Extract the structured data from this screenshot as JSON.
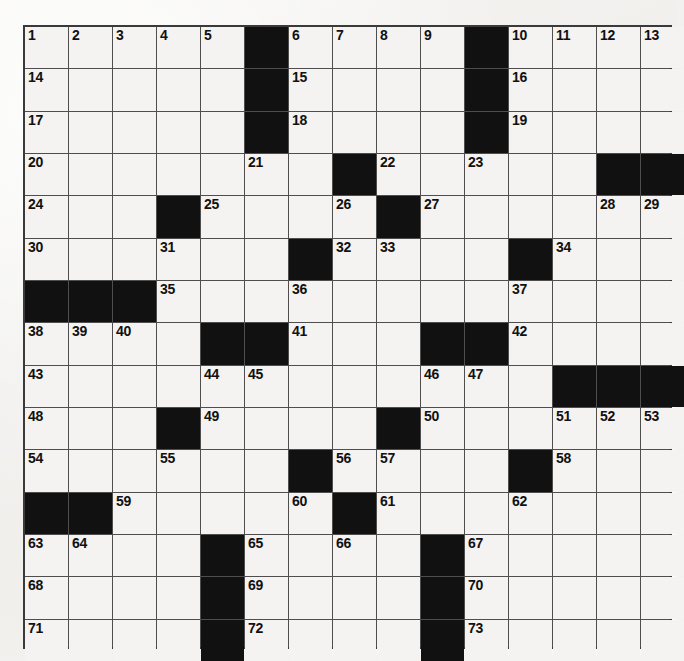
{
  "puzzle": {
    "type": "crossword-grid",
    "rows": 15,
    "columns": 15,
    "colors": {
      "background": "#f2f1ef",
      "cell_fill": "#f4f3f1",
      "block_fill": "#111111",
      "grid_line": "#4e4e4e",
      "border": "#3a3a3a",
      "number_text": "#111111"
    },
    "legend": {
      "white_code": 0,
      "black_code": 1
    },
    "blocks": [
      [
        0,
        0,
        0,
        0,
        0,
        1,
        0,
        0,
        0,
        0,
        1,
        0,
        0,
        0,
        0
      ],
      [
        0,
        0,
        0,
        0,
        0,
        1,
        0,
        0,
        0,
        0,
        1,
        0,
        0,
        0,
        0
      ],
      [
        0,
        0,
        0,
        0,
        0,
        1,
        0,
        0,
        0,
        0,
        1,
        0,
        0,
        0,
        0
      ],
      [
        0,
        0,
        0,
        0,
        0,
        0,
        0,
        1,
        0,
        0,
        0,
        0,
        0,
        1,
        1
      ],
      [
        0,
        0,
        0,
        1,
        0,
        0,
        0,
        0,
        1,
        0,
        0,
        0,
        0,
        0,
        0
      ],
      [
        0,
        0,
        0,
        0,
        0,
        0,
        1,
        0,
        0,
        0,
        0,
        1,
        0,
        0,
        0
      ],
      [
        1,
        1,
        1,
        0,
        0,
        0,
        0,
        0,
        0,
        0,
        0,
        0,
        0,
        0,
        0
      ],
      [
        0,
        0,
        0,
        0,
        1,
        1,
        0,
        0,
        0,
        1,
        1,
        0,
        0,
        0,
        0
      ],
      [
        0,
        0,
        0,
        0,
        0,
        0,
        0,
        0,
        0,
        0,
        0,
        0,
        1,
        1,
        1
      ],
      [
        0,
        0,
        0,
        1,
        0,
        0,
        0,
        0,
        1,
        0,
        0,
        0,
        0,
        0,
        0
      ],
      [
        0,
        0,
        0,
        0,
        0,
        0,
        1,
        0,
        0,
        0,
        0,
        1,
        0,
        0,
        0
      ],
      [
        1,
        1,
        0,
        0,
        0,
        0,
        0,
        1,
        0,
        0,
        0,
        0,
        0,
        0,
        0
      ],
      [
        0,
        0,
        0,
        0,
        1,
        0,
        0,
        0,
        0,
        1,
        0,
        0,
        0,
        0,
        0
      ],
      [
        0,
        0,
        0,
        0,
        1,
        0,
        0,
        0,
        0,
        1,
        0,
        0,
        0,
        0,
        0
      ],
      [
        0,
        0,
        0,
        0,
        1,
        0,
        0,
        0,
        0,
        1,
        0,
        0,
        0,
        0,
        0
      ]
    ],
    "numbers": [
      [
        1,
        2,
        3,
        4,
        5,
        null,
        6,
        7,
        8,
        9,
        null,
        10,
        11,
        12,
        13
      ],
      [
        14,
        null,
        null,
        null,
        null,
        null,
        15,
        null,
        null,
        null,
        null,
        16,
        null,
        null,
        null
      ],
      [
        17,
        null,
        null,
        null,
        null,
        null,
        18,
        null,
        null,
        null,
        null,
        19,
        null,
        null,
        null
      ],
      [
        20,
        null,
        null,
        null,
        null,
        21,
        null,
        null,
        22,
        null,
        23,
        null,
        null,
        null,
        null
      ],
      [
        24,
        null,
        null,
        null,
        25,
        null,
        null,
        26,
        null,
        27,
        null,
        null,
        null,
        28,
        29
      ],
      [
        30,
        null,
        null,
        31,
        null,
        null,
        null,
        32,
        33,
        null,
        null,
        null,
        34,
        null,
        null
      ],
      [
        null,
        null,
        null,
        35,
        null,
        null,
        36,
        null,
        null,
        null,
        null,
        37,
        null,
        null,
        null
      ],
      [
        38,
        39,
        40,
        null,
        null,
        null,
        41,
        null,
        null,
        null,
        null,
        42,
        null,
        null,
        null
      ],
      [
        43,
        null,
        null,
        null,
        44,
        45,
        null,
        null,
        null,
        46,
        47,
        null,
        null,
        null,
        null
      ],
      [
        48,
        null,
        null,
        null,
        49,
        null,
        null,
        null,
        null,
        50,
        null,
        null,
        51,
        52,
        53
      ],
      [
        54,
        null,
        null,
        55,
        null,
        null,
        null,
        56,
        57,
        null,
        null,
        null,
        58,
        null,
        null
      ],
      [
        null,
        null,
        59,
        null,
        null,
        null,
        60,
        null,
        61,
        null,
        null,
        62,
        null,
        null,
        null
      ],
      [
        63,
        64,
        null,
        null,
        null,
        65,
        null,
        66,
        null,
        null,
        67,
        null,
        null,
        null,
        null
      ],
      [
        68,
        null,
        null,
        null,
        null,
        69,
        null,
        null,
        null,
        null,
        70,
        null,
        null,
        null,
        null
      ],
      [
        71,
        null,
        null,
        null,
        null,
        72,
        null,
        null,
        null,
        null,
        73,
        null,
        null,
        null,
        null
      ]
    ],
    "letters": [
      [
        null,
        null,
        null,
        null,
        null,
        null,
        null,
        null,
        null,
        null,
        null,
        null,
        null,
        null,
        null
      ],
      [
        null,
        null,
        null,
        null,
        null,
        null,
        null,
        null,
        null,
        null,
        null,
        null,
        null,
        null,
        null
      ],
      [
        null,
        null,
        null,
        null,
        null,
        null,
        null,
        null,
        null,
        null,
        null,
        null,
        null,
        null,
        null
      ],
      [
        null,
        null,
        null,
        null,
        null,
        null,
        null,
        null,
        null,
        null,
        null,
        null,
        null,
        null,
        null
      ],
      [
        null,
        null,
        null,
        null,
        null,
        null,
        null,
        null,
        null,
        null,
        null,
        null,
        null,
        null,
        null
      ],
      [
        null,
        null,
        null,
        null,
        null,
        null,
        null,
        null,
        null,
        null,
        null,
        null,
        null,
        null,
        null
      ],
      [
        null,
        null,
        null,
        null,
        null,
        null,
        null,
        null,
        null,
        null,
        null,
        null,
        null,
        null,
        null
      ],
      [
        null,
        null,
        null,
        null,
        null,
        null,
        null,
        null,
        null,
        null,
        null,
        null,
        null,
        null,
        null
      ],
      [
        null,
        null,
        null,
        null,
        null,
        null,
        null,
        null,
        null,
        null,
        null,
        null,
        null,
        null,
        null
      ],
      [
        null,
        null,
        null,
        null,
        null,
        null,
        null,
        null,
        null,
        null,
        null,
        null,
        null,
        null,
        null
      ],
      [
        null,
        null,
        null,
        null,
        null,
        null,
        null,
        null,
        null,
        null,
        null,
        null,
        null,
        null,
        null
      ],
      [
        null,
        null,
        null,
        null,
        null,
        null,
        null,
        null,
        null,
        null,
        null,
        null,
        null,
        null,
        null
      ],
      [
        null,
        null,
        null,
        null,
        null,
        null,
        null,
        null,
        null,
        null,
        null,
        null,
        null,
        null,
        null
      ],
      [
        null,
        null,
        null,
        null,
        null,
        null,
        null,
        null,
        null,
        null,
        null,
        null,
        null,
        null,
        null
      ],
      [
        null,
        null,
        null,
        null,
        null,
        null,
        null,
        null,
        null,
        null,
        null,
        null,
        null,
        null,
        null
      ]
    ],
    "max_clue_number": 73
  }
}
